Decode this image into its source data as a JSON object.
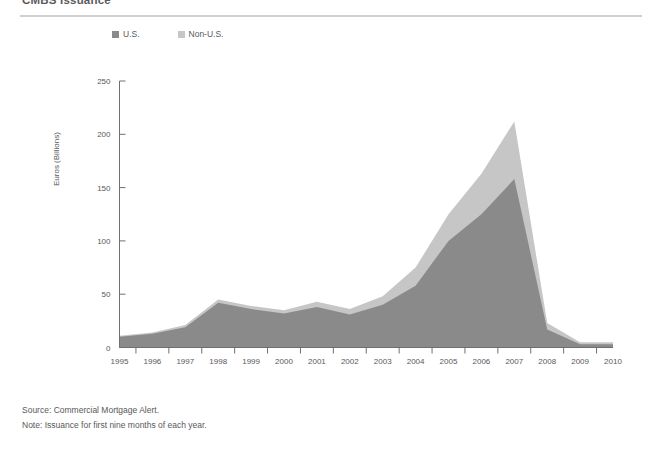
{
  "page": {
    "title": "CMBS Issuance"
  },
  "legend": {
    "position": "top",
    "items": [
      {
        "label": "U.S.",
        "color": "#8a8a8a",
        "swatch_name": "legend-swatch-us"
      },
      {
        "label": "Non-U.S.",
        "color": "#c6c6c6",
        "swatch_name": "legend-swatch-non-us"
      }
    ]
  },
  "footnotes": {
    "source": "Source: Commercial Mortgage Alert.",
    "note": "Note: Issuance for first nine months of each year."
  },
  "colors": {
    "us": "#8a8a8a",
    "non_us": "#c6c6c6",
    "axis": "#6f6f6f",
    "rule": "#d0d0d0",
    "text": "#58585a",
    "background": "#ffffff"
  },
  "chart_data": {
    "type": "area",
    "stacked": true,
    "title": "CMBS Issuance",
    "subtitle": "",
    "xlabel": "",
    "ylabel": "Euros (Billions)",
    "grid": false,
    "legend_position": "top",
    "categories": [
      "1995",
      "1996",
      "1997",
      "1998",
      "1999",
      "2000",
      "2001",
      "2002",
      "2003",
      "2004",
      "2005",
      "2006",
      "2007",
      "2008",
      "2009",
      "2010"
    ],
    "x": [
      1995,
      1996,
      1997,
      1998,
      1999,
      2000,
      2001,
      2002,
      2003,
      2004,
      2005,
      2006,
      2007,
      2008,
      2009,
      2010
    ],
    "xlim": [
      1995,
      2010
    ],
    "ylim": [
      0,
      250
    ],
    "yticks": [
      0,
      50,
      100,
      150,
      200,
      250
    ],
    "ytick_labels": [
      "0",
      "50",
      "100",
      "150",
      "200",
      "250"
    ],
    "xtick_labels": [
      "1995",
      "1996",
      "1997",
      "1998",
      "1999",
      "2000",
      "2001",
      "2002",
      "2003",
      "2004",
      "2005",
      "2006",
      "2007",
      "2008",
      "2009",
      "2010"
    ],
    "series": [
      {
        "name": "U.S.",
        "color": "#8a8a8a",
        "values": [
          10,
          13,
          19,
          42,
          36,
          32,
          38,
          31,
          40,
          58,
          100,
          125,
          158,
          17,
          3,
          3
        ]
      },
      {
        "name": "Non-U.S.",
        "color": "#c6c6c6",
        "values": [
          1,
          1,
          2,
          3,
          3,
          3,
          5,
          5,
          8,
          17,
          25,
          38,
          54,
          6,
          2,
          2
        ]
      }
    ],
    "totals": [
      11,
      14,
      21,
      45,
      39,
      35,
      43,
      36,
      48,
      75,
      125,
      163,
      212,
      23,
      5,
      5
    ],
    "annotations": []
  }
}
